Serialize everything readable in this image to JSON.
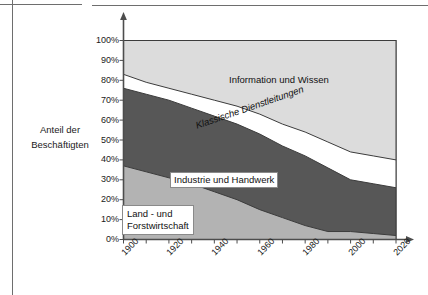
{
  "page": {
    "axis_caption_line1": "Anteil der",
    "axis_caption_line2": "Beschäftigten"
  },
  "colors": {
    "land_forstwirtschaft": "#b3b3b3",
    "industrie_handwerk": "#575757",
    "klassische_dienstleitungen": "#ffffff",
    "information_wissen": "#dcdcdc",
    "axis": "#4d4d4d",
    "outline": "#3c3c3c",
    "frame_rule": "#6e6e6e",
    "text": "#1a1a1a"
  },
  "chart_data": {
    "type": "area",
    "stacked": true,
    "title": "",
    "xlabel": "",
    "ylabel": "Anteil der Beschäftigten",
    "ylim": [
      0,
      100
    ],
    "xlim": [
      1900,
      2020
    ],
    "grid": false,
    "legend_position": "inline-annotations",
    "x": [
      1900,
      1910,
      1920,
      1930,
      1940,
      1950,
      1960,
      1970,
      1980,
      1990,
      2000,
      2010,
      2020
    ],
    "ytick_labels": [
      "100%",
      "90%",
      "80%",
      "70%",
      "60%",
      "50%",
      "40%",
      "30%",
      "20%",
      "10%",
      "0%"
    ],
    "ytick_values": [
      100,
      90,
      80,
      70,
      60,
      50,
      40,
      30,
      20,
      10,
      0
    ],
    "xtick_labels": [
      "1900",
      "1920",
      "1940",
      "1960",
      "1980",
      "2000",
      "2020"
    ],
    "xtick_values": [
      1900,
      1920,
      1940,
      1960,
      1980,
      2000,
      2020
    ],
    "minor_xtick_values": [
      1910,
      1930,
      1950,
      1970,
      1990,
      2010
    ],
    "series": [
      {
        "name": "Land - und Forstwirtschaft",
        "label_line1": "Land - und",
        "label_line2": "Forstwirtschaft",
        "color": "#b3b3b3",
        "values": [
          37,
          34,
          31,
          28,
          24,
          20,
          15,
          11,
          7,
          4,
          4,
          3,
          2
        ]
      },
      {
        "name": "Industrie und Handwerk",
        "label": "Industrie und Handwerk",
        "color": "#575757",
        "values": [
          39,
          39,
          39,
          38,
          38,
          38,
          38,
          36,
          35,
          32,
          26,
          25,
          24
        ]
      },
      {
        "name": "Klassische Dienstleitungen",
        "label": "Klassische Dienstleitungen",
        "color": "#ffffff",
        "values": [
          7,
          6,
          6,
          7,
          8,
          9,
          10,
          11,
          12,
          13,
          14,
          14,
          14
        ]
      },
      {
        "name": "Information und Wissen",
        "label": "Information und Wissen",
        "color": "#dcdcdc",
        "values": [
          17,
          21,
          24,
          27,
          30,
          33,
          37,
          42,
          46,
          51,
          56,
          58,
          60
        ]
      }
    ],
    "cumulative_tops": {
      "land_forstwirtschaft": [
        37,
        34,
        31,
        28,
        24,
        20,
        15,
        11,
        7,
        4,
        4,
        3,
        2
      ],
      "industrie_handwerk": [
        76,
        73,
        70,
        66,
        62,
        58,
        53,
        47,
        42,
        36,
        30,
        28,
        26
      ],
      "klassische_dienstleitungen": [
        83,
        79,
        76,
        73,
        70,
        67,
        63,
        58,
        54,
        49,
        44,
        42,
        40
      ],
      "information_wissen": [
        100,
        100,
        100,
        100,
        100,
        100,
        100,
        100,
        100,
        100,
        100,
        100,
        100
      ]
    }
  }
}
